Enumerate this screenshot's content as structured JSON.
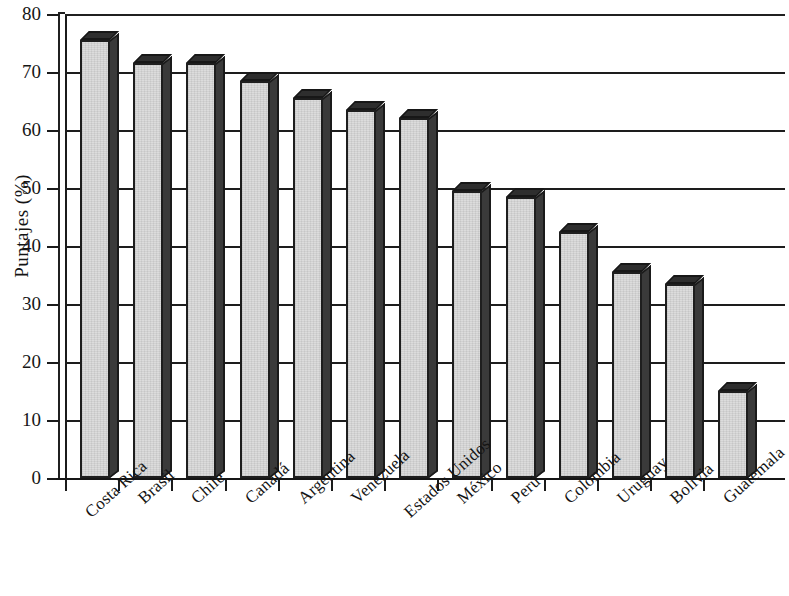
{
  "chart_data": {
    "type": "bar",
    "title": "",
    "subtitle": "",
    "xlabel": "",
    "ylabel": "Puntajes (%)",
    "ylim": [
      0,
      80
    ],
    "ytick_step": 10,
    "yticks": [
      "0",
      "10",
      "20",
      "30",
      "40",
      "50",
      "60",
      "70",
      "80"
    ],
    "grid": "horizontal",
    "legend": "none",
    "style": "3d-column-grayscale",
    "categories": [
      "Costa Rica",
      "Brasil",
      "Chile",
      "Canadá",
      "Argentina",
      "Venezuela",
      "Estados Unidos",
      "México",
      "Perú",
      "Colombia",
      "Uruguay",
      "Bolivia",
      "Guatemala"
    ],
    "values": [
      75.5,
      71.5,
      71.5,
      68.5,
      65.5,
      63.5,
      62,
      49.5,
      48.5,
      42.5,
      35.5,
      33.5,
      15
    ],
    "series": [
      {
        "name": "Puntajes",
        "values": [
          75.5,
          71.5,
          71.5,
          68.5,
          65.5,
          63.5,
          62,
          49.5,
          48.5,
          42.5,
          35.5,
          33.5,
          15
        ]
      }
    ],
    "colors": {
      "bar_face": "#dcdcdc",
      "bar_side": "#3a3a3a",
      "bar_top": "#2e2e2e",
      "outline": "#1e1e1e",
      "axis": "#1b1b1b",
      "gridline": "#1d1d1d",
      "text": "#141414",
      "background": "#ffffff"
    }
  }
}
